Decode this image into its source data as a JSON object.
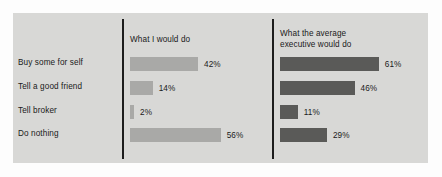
{
  "chart_data": {
    "type": "bar",
    "title": "",
    "xlabel": "",
    "ylabel": "",
    "orientation": "horizontal",
    "grid": false,
    "legend_position": "panel-headings",
    "value_suffix": "%",
    "xlim": [
      0,
      100
    ],
    "categories": [
      "Buy some for self",
      "Tell a good friend",
      "Tell broker",
      "Do nothing"
    ],
    "series": [
      {
        "name": "What I would do",
        "color": "#a9a9a7",
        "values": [
          42,
          14,
          2,
          56
        ],
        "labels": [
          "42%",
          "14%",
          "2%",
          "56%"
        ]
      },
      {
        "name": "What the average executive would do",
        "color": "#5a5a58",
        "values": [
          61,
          46,
          11,
          29
        ],
        "labels": [
          "61%",
          "46%",
          "11%",
          "29%"
        ]
      }
    ]
  },
  "panels": {
    "left": {
      "heading": "What I would do"
    },
    "right": {
      "heading_line1": "What the average",
      "heading_line2": "executive would do"
    }
  },
  "colors": {
    "background": "#fdfdfd",
    "panel": "#d8d8d6",
    "divider": "#1c1c1c",
    "bar_light": "#a9a9a7",
    "bar_dark": "#5a5a58",
    "text": "#1a1a1a"
  }
}
